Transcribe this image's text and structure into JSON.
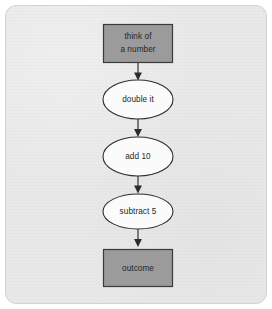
{
  "diagram": {
    "background_color": "#e9e9e9",
    "frame_border_color": "#d2d2d2",
    "process_fill_color": "#9b9b9b",
    "process_stroke_color": "#3b3b3b",
    "ellipse_fill_color": "#fbfbfb",
    "ellipse_stroke_color": "#2e2e2e",
    "connector_color": "#2b2b2b",
    "nodes": [
      {
        "id": "think-of-a-number",
        "shape": "rectangle",
        "lines": [
          "think of",
          "a number"
        ],
        "label": "think of a number"
      },
      {
        "id": "double-it",
        "shape": "ellipse",
        "lines": [
          "double it"
        ],
        "label": "double it"
      },
      {
        "id": "add-10",
        "shape": "ellipse",
        "lines": [
          "add 10"
        ],
        "label": "add 10"
      },
      {
        "id": "subtract-5",
        "shape": "ellipse",
        "lines": [
          "subtract 5"
        ],
        "label": "subtract 5"
      },
      {
        "id": "outcome",
        "shape": "rectangle",
        "lines": [
          "outcome"
        ],
        "label": "outcome"
      }
    ],
    "edges": [
      {
        "from": "think-of-a-number",
        "to": "double-it",
        "label": ""
      },
      {
        "from": "double-it",
        "to": "add-10",
        "label": ""
      },
      {
        "from": "add-10",
        "to": "subtract-5",
        "label": ""
      },
      {
        "from": "subtract-5",
        "to": "outcome",
        "label": ""
      }
    ]
  }
}
